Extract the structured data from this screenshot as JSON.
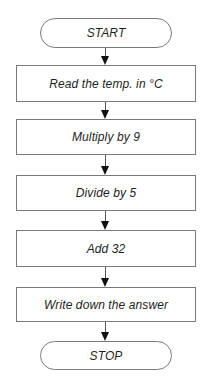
{
  "flowchart": {
    "title": "",
    "nodes": [
      {
        "id": "start",
        "type": "terminal",
        "label": "START"
      },
      {
        "id": "step1",
        "type": "process",
        "label": "Read the temp. in °C"
      },
      {
        "id": "step2",
        "type": "process",
        "label": "Multiply by 9"
      },
      {
        "id": "step3",
        "type": "process",
        "label": "Divide by 5"
      },
      {
        "id": "step4",
        "type": "process",
        "label": "Add 32"
      },
      {
        "id": "step5",
        "type": "process",
        "label": "Write down the answer"
      },
      {
        "id": "stop",
        "type": "terminal",
        "label": "STOP"
      }
    ],
    "edges": [
      {
        "from": "start",
        "to": "step1"
      },
      {
        "from": "step1",
        "to": "step2"
      },
      {
        "from": "step2",
        "to": "step3"
      },
      {
        "from": "step3",
        "to": "step4"
      },
      {
        "from": "step4",
        "to": "step5"
      },
      {
        "from": "step5",
        "to": "stop"
      }
    ],
    "colors": {
      "border": "#7a7a7a",
      "text": "#1e1e1e",
      "arrow": "#111111",
      "background": "#ffffff"
    }
  }
}
